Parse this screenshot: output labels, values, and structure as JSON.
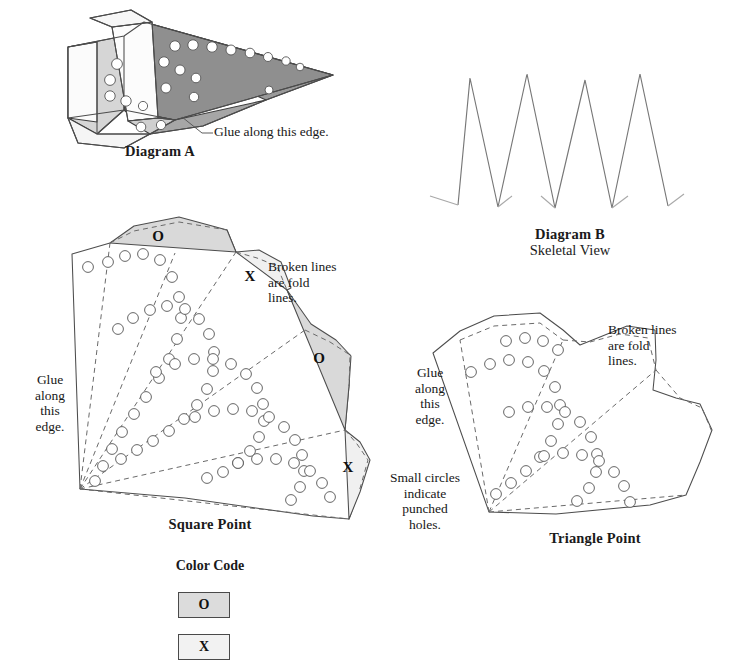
{
  "page": {
    "background": "#ffffff",
    "width": 750,
    "height": 667
  },
  "palette": {
    "ink": "#1a1a1a",
    "solid_line": "#4d4d4d",
    "fold_line": "#6a6a6a",
    "hole_stroke": "#555555",
    "facet_white": "#ffffff",
    "facet_light": "#d2d2d2",
    "facet_mid": "#b4b4b4",
    "facet_dark": "#9a9a9a",
    "tab_o_fill": "#d9d9d9",
    "tab_x_fill": "#f0f0f0",
    "swatch_o_fill": "#dcdcdc",
    "swatch_x_fill": "#f2f2f2",
    "swatch_border": "#4a4a4a"
  },
  "diagram_a": {
    "caption": "Diagram A",
    "glue_note": "Glue along this edge.",
    "leader": {
      "x1": 182,
      "y1": 117,
      "x2": 202,
      "y2": 133,
      "x3": 213,
      "y3": 133
    },
    "note_pos": {
      "x": 214,
      "y": 124
    },
    "caption_pos": {
      "x": 70,
      "y": 143,
      "width": 180
    },
    "facets": [
      {
        "name": "wing-upper-dark",
        "fill": "#9a9a9a",
        "points": "124,36 144,22 333,75 266,100"
      },
      {
        "name": "wing-main-dark",
        "fill": "#8f8f8f",
        "points": "144,22 333,75 175,120 124,110"
      },
      {
        "name": "wing-lower-mid",
        "fill": "#a6a6a6",
        "points": "124,110 175,120 266,100 203,126 150,134"
      },
      {
        "name": "body-left-light",
        "fill": "#d6d6d6",
        "points": "68,47 124,36 124,110 97,134 68,118"
      },
      {
        "name": "body-front-white",
        "fill": "#fbfbfb",
        "points": "68,47 97,42 97,122 68,118"
      },
      {
        "name": "crease-panel-white",
        "fill": "#fcfcfc",
        "points": "112,27 152,22 158,118 128,121"
      },
      {
        "name": "top-flap-white",
        "fill": "#f7f7f7",
        "points": "90,18 131,10 152,22 112,27"
      },
      {
        "name": "bottom-flap-white",
        "fill": "#f5f5f5",
        "points": "68,118 97,134 150,134 124,148 78,143"
      },
      {
        "name": "nose-flap-light",
        "fill": "#cfcfcf",
        "points": "128,121 158,118 175,120 150,134"
      }
    ],
    "holes": [
      {
        "cx": 175,
        "cy": 46,
        "r": 5.2
      },
      {
        "cx": 193,
        "cy": 45,
        "r": 5.2
      },
      {
        "cx": 212,
        "cy": 47,
        "r": 5.2
      },
      {
        "cx": 231,
        "cy": 50,
        "r": 5.0
      },
      {
        "cx": 250,
        "cy": 53,
        "r": 4.8
      },
      {
        "cx": 268,
        "cy": 57,
        "r": 4.5
      },
      {
        "cx": 286,
        "cy": 61,
        "r": 4.2
      },
      {
        "cx": 300,
        "cy": 67,
        "r": 3.8
      },
      {
        "cx": 164,
        "cy": 62,
        "r": 5.2
      },
      {
        "cx": 180,
        "cy": 70,
        "r": 5.0
      },
      {
        "cx": 196,
        "cy": 78,
        "r": 4.8
      },
      {
        "cx": 166,
        "cy": 88,
        "r": 5.0
      },
      {
        "cx": 194,
        "cy": 97,
        "r": 4.7
      },
      {
        "cx": 269,
        "cy": 90,
        "r": 4.0
      },
      {
        "cx": 117,
        "cy": 64,
        "r": 5.4
      },
      {
        "cx": 110,
        "cy": 80,
        "r": 5.4
      },
      {
        "cx": 110,
        "cy": 96,
        "r": 5.2
      },
      {
        "cx": 126,
        "cy": 101,
        "r": 5.2
      },
      {
        "cx": 143,
        "cy": 106,
        "r": 4.6
      },
      {
        "cx": 141,
        "cy": 127,
        "r": 4.8
      },
      {
        "cx": 161,
        "cy": 125,
        "r": 4.6
      }
    ],
    "edges": [
      "M68,47 L124,36 L144,22 L333,75 L266,100 L203,126 L150,134 L124,148 L78,143 L68,118 Z",
      "M124,36 L124,110 L68,118",
      "M124,110 L175,120 L333,75",
      "M175,120 L150,134",
      "M124,110 L97,134 L150,134",
      "M97,42 L97,134",
      "M68,47 L97,42",
      "M112,27 L90,18 L131,10 L152,22 L112,27 L128,121 L158,118 L152,22",
      "M158,118 L175,120"
    ]
  },
  "diagram_b": {
    "caption": "Diagram B",
    "subcaption": "Skeletal View",
    "caption_pos": {
      "x": 485,
      "y": 226,
      "width": 170
    },
    "zigzag_path": "M458,205 L470,78 L498,207 L527,74 L555,208 L585,80 L612,208 L640,74 L668,206",
    "tabs": [
      "M458,205 L430,196",
      "M498,207 L512,196",
      "M555,208 L541,196",
      "M612,208 L628,196",
      "M668,206 L684,194"
    ]
  },
  "square_point": {
    "caption": "Square Point",
    "caption_pos": {
      "x": 135,
      "y": 516,
      "width": 150
    },
    "glue_note": [
      "Glue",
      "along",
      "this",
      "edge."
    ],
    "glue_note_pos": {
      "x": 26,
      "y": 372,
      "width": 48
    },
    "fold_note": [
      "Broken lines",
      "are fold",
      "lines."
    ],
    "fold_note_pos": {
      "x": 268,
      "y": 259,
      "width": 92
    },
    "outline": "M72,254 L110,243 L134,231 L179,222 L227,230 L236,252 L257,258 L277,266 L287,290 L305,330 L330,342 L350,355 L349,386 L345,430 L357,444 L368,460 L359,492 L349,519 L313,516 L185,498 L80,489 Z",
    "fold_lines": [
      "M80,489 L110,243",
      "M80,489 L175,253",
      "M80,489 L236,252",
      "M80,489 L305,330",
      "M80,489 L345,430",
      "M80,489 L349,519",
      "M110,243 L134,231 L179,222 L227,230",
      "M236,252 L257,258 L277,266 L287,290",
      "M305,330 L330,342 L350,355 L349,386",
      "M345,430 L357,444 L368,460 L359,492"
    ],
    "tabs": [
      {
        "label": "O",
        "fill": "#d9d9d9",
        "points": "110,243 134,226 179,217 227,230 236,252",
        "label_x": 158,
        "label_y": 241
      },
      {
        "label": "X",
        "fill": "#f0f0f0",
        "points": "236,252 259,250 281,262 291,288 287,290",
        "label_x": 250,
        "label_y": 281
      },
      {
        "label": "O",
        "fill": "#d9d9d9",
        "points": "287,290 311,324 336,340 351,356 349,386 345,430",
        "label_x": 319,
        "label_y": 363
      },
      {
        "label": "X",
        "fill": "#f0f0f0",
        "points": "345,430 360,442 370,460 360,492 349,519",
        "label_x": 348,
        "label_y": 472
      }
    ],
    "hole_arcs": [
      {
        "name": "arc-1",
        "holes": [
          [
            88,
            267
          ],
          [
            108,
            262
          ],
          [
            125,
            256
          ],
          [
            143,
            254
          ],
          [
            160,
            260
          ],
          [
            172,
            277
          ],
          [
            179,
            297
          ],
          [
            181,
            318
          ],
          [
            177,
            339
          ],
          [
            169,
            359
          ],
          [
            159,
            378
          ],
          [
            146,
            397
          ],
          [
            134,
            414
          ],
          [
            122,
            432
          ],
          [
            112,
            449
          ],
          [
            103,
            466
          ],
          [
            95,
            481
          ]
        ]
      },
      {
        "name": "arc-2",
        "holes": [
          [
            118,
            329
          ],
          [
            133,
            318
          ],
          [
            150,
            310
          ],
          [
            167,
            306
          ],
          [
            185,
            309
          ],
          [
            199,
            319
          ],
          [
            209,
            334
          ],
          [
            214,
            352
          ],
          [
            213,
            371
          ],
          [
            207,
            389
          ],
          [
            197,
            405
          ],
          [
            184,
            419
          ],
          [
            169,
            431
          ],
          [
            153,
            441
          ],
          [
            137,
            450
          ],
          [
            121,
            459
          ]
        ]
      },
      {
        "name": "arc-3",
        "holes": [
          [
            156,
            372
          ],
          [
            175,
            364
          ],
          [
            194,
            359
          ],
          [
            213,
            359
          ],
          [
            231,
            364
          ],
          [
            246,
            374
          ],
          [
            257,
            388
          ],
          [
            263,
            404
          ],
          [
            264,
            421
          ],
          [
            259,
            437
          ],
          [
            250,
            451
          ],
          [
            238,
            463
          ],
          [
            223,
            472
          ],
          [
            207,
            478
          ]
        ]
      },
      {
        "name": "arc-4",
        "holes": [
          [
            195,
            417
          ],
          [
            214,
            411
          ],
          [
            233,
            409
          ],
          [
            252,
            411
          ],
          [
            269,
            417
          ],
          [
            284,
            427
          ],
          [
            295,
            440
          ],
          [
            302,
            455
          ],
          [
            304,
            471
          ],
          [
            300,
            487
          ],
          [
            291,
            500
          ]
        ]
      },
      {
        "name": "arc-5",
        "holes": [
          [
            238,
            463
          ],
          [
            257,
            459
          ],
          [
            276,
            459
          ],
          [
            294,
            463
          ],
          [
            310,
            471
          ],
          [
            322,
            483
          ],
          [
            330,
            497
          ]
        ]
      }
    ],
    "hole_radius": 5.4
  },
  "triangle_point": {
    "caption": "Triangle Point",
    "caption_pos": {
      "x": 520,
      "y": 530,
      "width": 150
    },
    "glue_note": [
      "Glue",
      "along",
      "this",
      "edge."
    ],
    "glue_note_pos": {
      "x": 406,
      "y": 365,
      "width": 48
    },
    "fold_note": [
      "Broken lines",
      "are fold",
      "lines."
    ],
    "fold_note_pos": {
      "x": 608,
      "y": 322,
      "width": 92
    },
    "holes_note": [
      "Small circles",
      "indicate",
      "punched",
      "holes."
    ],
    "holes_note_pos": {
      "x": 375,
      "y": 470,
      "width": 100
    },
    "outline": "M433,353 L460,331 L494,316 L540,313 L563,330 L580,345 L600,337 L627,326 L655,330 L656,360 L653,390 L676,398 L700,404 L712,430 L700,462 L686,495 L650,505 L556,514 L489,512 Z",
    "fold_lines": [
      "M489,512 L460,340",
      "M489,512 L563,340",
      "M489,512 L656,370",
      "M489,512 L686,495",
      "M460,340 L494,326 L540,323 L563,340",
      "M563,340 L590,342 L620,334 L648,338 L656,370",
      "M656,370 L680,398 L702,408 L712,432"
    ],
    "hole_arcs": [
      {
        "name": "arc-1",
        "holes": [
          [
            471,
            372
          ],
          [
            490,
            364
          ],
          [
            509,
            360
          ],
          [
            528,
            362
          ],
          [
            544,
            371
          ],
          [
            555,
            387
          ],
          [
            560,
            405
          ],
          [
            558,
            424
          ],
          [
            551,
            441
          ],
          [
            540,
            457
          ],
          [
            526,
            471
          ],
          [
            511,
            483
          ],
          [
            496,
            494
          ]
        ]
      },
      {
        "name": "arc-2",
        "holes": [
          [
            509,
            412
          ],
          [
            528,
            407
          ],
          [
            547,
            407
          ],
          [
            565,
            412
          ],
          [
            580,
            422
          ],
          [
            591,
            437
          ],
          [
            597,
            454
          ],
          [
            596,
            472
          ],
          [
            589,
            488
          ],
          [
            577,
            501
          ]
        ]
      },
      {
        "name": "arc-3",
        "holes": [
          [
            544,
            456
          ],
          [
            563,
            453
          ],
          [
            582,
            455
          ],
          [
            599,
            461
          ],
          [
            614,
            472
          ],
          [
            624,
            486
          ],
          [
            630,
            502
          ]
        ]
      },
      {
        "name": "arc-4",
        "holes": [
          [
            506,
            341
          ],
          [
            525,
            338
          ],
          [
            543,
            341
          ],
          [
            558,
            350
          ]
        ]
      }
    ],
    "hole_radius": 5.4
  },
  "color_code": {
    "title": "Color Code",
    "title_pos": {
      "x": 160,
      "y": 558,
      "width": 100
    },
    "swatches": [
      {
        "label": "O",
        "fill": "#dcdcdc",
        "x": 178,
        "y": 592,
        "w": 52,
        "h": 26
      },
      {
        "label": "X",
        "fill": "#f2f2f2",
        "x": 178,
        "y": 634,
        "w": 52,
        "h": 26
      }
    ]
  }
}
